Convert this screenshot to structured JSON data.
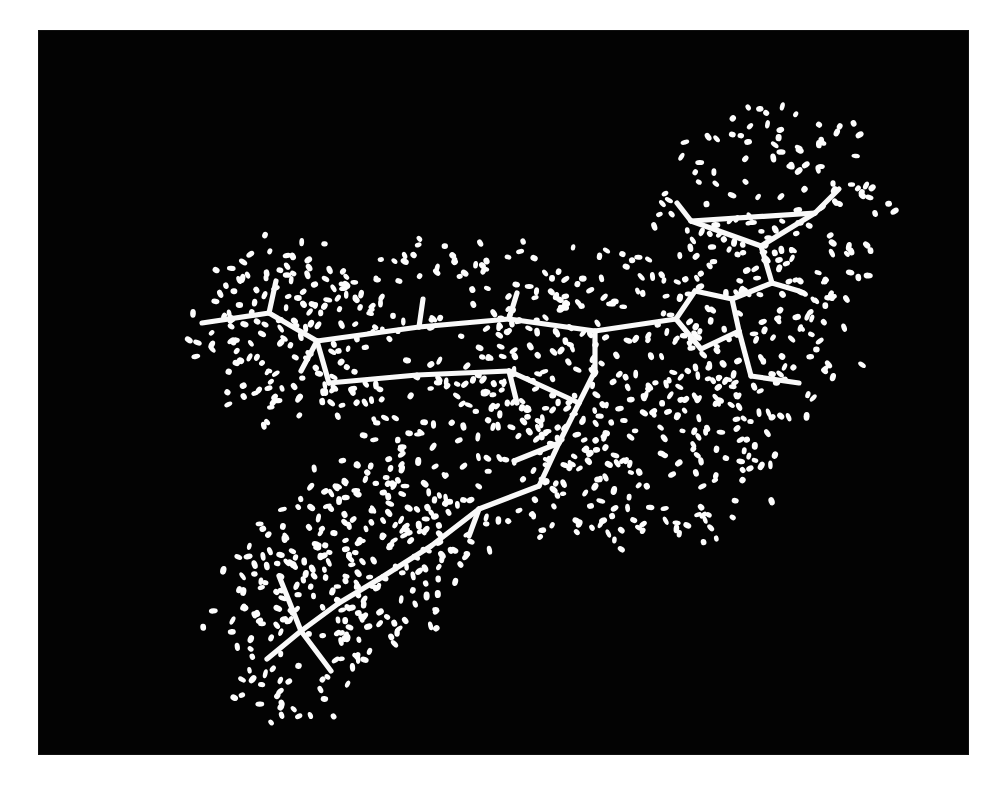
{
  "figure": {
    "kind": "molecular-structure-visualization",
    "render_style": "stick model with dotted van der Waals (Connolly) surface",
    "background_color": "#030303",
    "page_color": "#ffffff",
    "stick_color": "#f2f2f2",
    "dot_color": "#f6f6f6",
    "panel": {
      "x": 39,
      "y": 31,
      "width": 929,
      "height": 723
    }
  },
  "chart_data": {
    "type": "scatter",
    "title": "",
    "xlabel": "",
    "ylabel": "",
    "xlim": [
      0,
      929
    ],
    "ylim": [
      0,
      723
    ],
    "grid": false,
    "legend": "none",
    "annotations": [
      "cyclopropyl group at upper right",
      "fused bicyclic aromatic ring core at center",
      "long alkyl zig-zag chain descending to lower left",
      "terminal gem-dimethyl / isopropyl cap at lower left",
      "dotted van der Waals surface envelope surrounding the whole molecule"
    ],
    "stick_bonds": [
      [
        163,
        292,
        230,
        282
      ],
      [
        230,
        282,
        237,
        250
      ],
      [
        230,
        282,
        278,
        310
      ],
      [
        278,
        310,
        262,
        340
      ],
      [
        278,
        310,
        380,
        296
      ],
      [
        380,
        296,
        384,
        268
      ],
      [
        380,
        296,
        470,
        288
      ],
      [
        470,
        288,
        478,
        262
      ],
      [
        470,
        288,
        556,
        300
      ],
      [
        556,
        300,
        556,
        340
      ],
      [
        556,
        300,
        637,
        288
      ],
      [
        637,
        288,
        656,
        260
      ],
      [
        656,
        260,
        693,
        268
      ],
      [
        693,
        268,
        700,
        300
      ],
      [
        700,
        300,
        662,
        318
      ],
      [
        662,
        318,
        637,
        288
      ],
      [
        693,
        268,
        733,
        252
      ],
      [
        733,
        252,
        760,
        260
      ],
      [
        733,
        252,
        722,
        215
      ],
      [
        722,
        215,
        652,
        190
      ],
      [
        722,
        215,
        776,
        182
      ],
      [
        652,
        190,
        776,
        182
      ],
      [
        652,
        190,
        638,
        172
      ],
      [
        776,
        182,
        800,
        158
      ],
      [
        700,
        300,
        712,
        345
      ],
      [
        712,
        345,
        760,
        352
      ],
      [
        278,
        310,
        290,
        352
      ],
      [
        290,
        352,
        378,
        344
      ],
      [
        378,
        344,
        470,
        340
      ],
      [
        470,
        340,
        478,
        372
      ],
      [
        470,
        340,
        540,
        372
      ],
      [
        540,
        372,
        556,
        340
      ],
      [
        540,
        372,
        520,
        412
      ],
      [
        520,
        412,
        475,
        430
      ],
      [
        520,
        412,
        500,
        455
      ],
      [
        500,
        455,
        440,
        478
      ],
      [
        440,
        478,
        430,
        505
      ],
      [
        440,
        478,
        392,
        515
      ],
      [
        392,
        515,
        340,
        548
      ],
      [
        340,
        548,
        300,
        572
      ],
      [
        300,
        572,
        262,
        600
      ],
      [
        262,
        600,
        240,
        545
      ],
      [
        262,
        600,
        292,
        640
      ],
      [
        262,
        600,
        228,
        628
      ]
    ],
    "surface_dot_count": 1150,
    "surface_lobes": [
      {
        "cx": 740,
        "cy": 185,
        "rx": 128,
        "ry": 128,
        "density": 1.0
      },
      {
        "cx": 700,
        "cy": 300,
        "rx": 132,
        "ry": 120,
        "density": 1.0
      },
      {
        "cx": 560,
        "cy": 330,
        "rx": 150,
        "ry": 130,
        "density": 1.0
      },
      {
        "cx": 410,
        "cy": 305,
        "rx": 165,
        "ry": 115,
        "density": 1.0
      },
      {
        "cx": 250,
        "cy": 300,
        "rx": 108,
        "ry": 105,
        "density": 1.0
      },
      {
        "cx": 430,
        "cy": 430,
        "rx": 150,
        "ry": 110,
        "density": 1.0
      },
      {
        "cx": 600,
        "cy": 420,
        "rx": 150,
        "ry": 115,
        "density": 1.0
      },
      {
        "cx": 330,
        "cy": 520,
        "rx": 120,
        "ry": 100,
        "density": 1.0
      },
      {
        "cx": 250,
        "cy": 600,
        "rx": 108,
        "ry": 105,
        "density": 1.0
      }
    ]
  }
}
